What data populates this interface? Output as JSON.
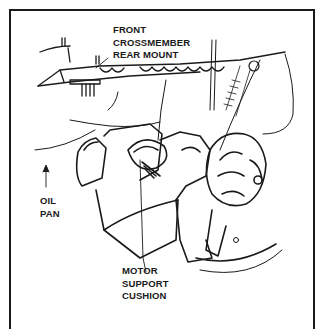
{
  "diagram": {
    "type": "technical-illustration",
    "colors": {
      "line": "#1a1a1a",
      "background": "#ffffff"
    },
    "labels": [
      {
        "id": "front-crossmember-rear-mount",
        "lines": [
          "FRONT",
          "CROSSMEMBER",
          "REAR MOUNT"
        ]
      },
      {
        "id": "oil-pan",
        "lines": [
          "OIL",
          "PAN"
        ]
      },
      {
        "id": "motor-support-cushion",
        "lines": [
          "MOTOR",
          "SUPPORT",
          "CUSHION"
        ]
      }
    ]
  }
}
